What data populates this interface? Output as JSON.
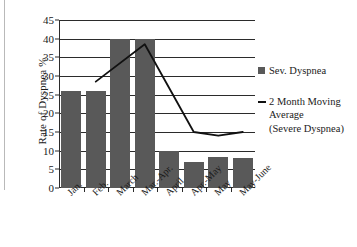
{
  "chart_data": {
    "type": "bar",
    "title": "",
    "xlabel": "",
    "ylabel": "Rate of Dyspnea %",
    "ylim": [
      0,
      45
    ],
    "yticks": [
      0,
      5,
      10,
      15,
      20,
      25,
      30,
      35,
      40,
      45
    ],
    "grid": true,
    "legend_position": "right",
    "categories": [
      "Jan.",
      "Feb.",
      "March",
      "Mar.-Apr.",
      "April",
      "Apr.-May",
      "May",
      "May-June"
    ],
    "series": [
      {
        "name": "Sev. Dyspnea",
        "type": "bar",
        "color": "#595959",
        "values": [
          26,
          26,
          40,
          40,
          10,
          7,
          8.3,
          8
        ]
      },
      {
        "name": "2 Month Moving Average (Severe Dyspnea)",
        "type": "line",
        "color": "#111111",
        "values": [
          null,
          28.5,
          null,
          38.5,
          null,
          15,
          14,
          15
        ]
      }
    ]
  },
  "legend": {
    "entries": [
      {
        "marker": "square-swatch",
        "label": "Sev. Dyspnea",
        "lines": [
          "Sev. Dyspnea"
        ]
      },
      {
        "marker": "line-swatch",
        "label": "2 Month Moving Average (Severe Dyspnea)",
        "lines": [
          "2 Month Moving",
          "Average",
          "(Severe Dyspnea)"
        ]
      }
    ]
  }
}
